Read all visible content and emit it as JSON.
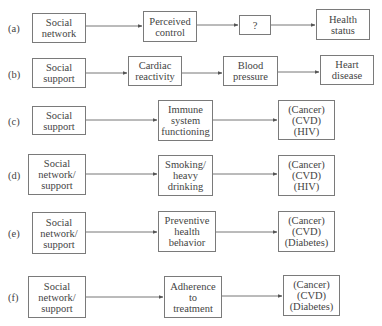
{
  "diagram": {
    "rows": [
      {
        "label": "(a)",
        "nodes": [
          "Social\nnetwork",
          "Perceived\ncontrol",
          "?",
          "Health\nstatus"
        ]
      },
      {
        "label": "(b)",
        "nodes": [
          "Social\nsupport",
          "Cardiac\nreactivity",
          "Blood\npressure",
          "Heart\ndisease"
        ]
      },
      {
        "label": "(c)",
        "nodes": [
          "Social\nsupport",
          "Immune\nsystem\nfunctioning",
          "(Cancer)\n(CVD)\n(HIV)"
        ]
      },
      {
        "label": "(d)",
        "nodes": [
          "Social\nnetwork/\nsupport",
          "Smoking/\nheavy\ndrinking",
          "(Cancer)\n(CVD)\n(HIV)"
        ]
      },
      {
        "label": "(e)",
        "nodes": [
          "Social\nnetwork/\nsupport",
          "Preventive\nhealth\nbehavior",
          "(Cancer)\n(CVD)\n(Diabetes)"
        ]
      },
      {
        "label": "(f)",
        "nodes": [
          "Social\nnetwork/\nsupport",
          "Adherence\nto\ntreatment",
          "(Cancer)\n(CVD)\n(Diabetes)"
        ]
      }
    ],
    "colors": {
      "box_border": "#7a7a7a",
      "arrow": "#555555",
      "text": "#444444",
      "background": "#ffffff"
    }
  }
}
